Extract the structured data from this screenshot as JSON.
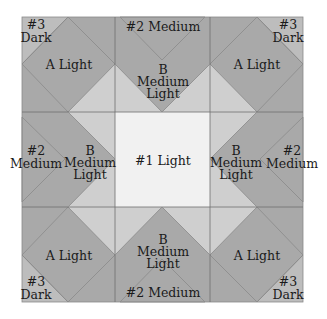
{
  "diagram": {
    "type": "quilt-block-layout",
    "colors": {
      "light": "#f7f7f7",
      "center_light": "#f1f1f1",
      "medium_light": "#cfcfcf",
      "band": "#a9a9a9",
      "medium": "#c9c9c9",
      "dark": "#bdbdbd",
      "seam": "#6e6e6e"
    },
    "labels": {
      "corner_tl": {
        "line1": "#3",
        "line2": "Dark"
      },
      "corner_tr": {
        "line1": "#3",
        "line2": "Dark"
      },
      "corner_bl": {
        "line1": "#3",
        "line2": "Dark"
      },
      "corner_br": {
        "line1": "#3",
        "line2": "Dark"
      },
      "a_tl": "A Light",
      "a_tr": "A Light",
      "a_bl": "A Light",
      "a_br": "A Light",
      "medium_top": "#2 Medium",
      "medium_bottom": "#2 Medium",
      "medium_left": {
        "line1": "#2",
        "line2": "Medium"
      },
      "medium_right": {
        "line1": "#2",
        "line2": "Medium"
      },
      "b_top": {
        "line1": "B",
        "line2": "Medium",
        "line3": "Light"
      },
      "b_bottom": {
        "line1": "B",
        "line2": "Medium",
        "line3": "Light"
      },
      "b_left": {
        "line1": "B",
        "line2": "Medium",
        "line3": "Light"
      },
      "b_right": {
        "line1": "B",
        "line2": "Medium",
        "line3": "Light"
      },
      "center": "#1 Light"
    }
  }
}
